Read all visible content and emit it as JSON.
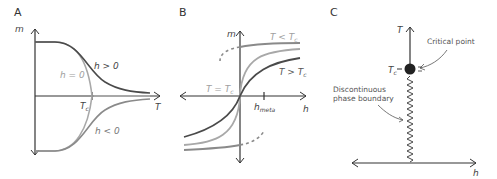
{
  "colors": {
    "axis": "#333333",
    "dark": "#4a4a4a",
    "mid": "#8a8a8a",
    "light": "#a8a8a8",
    "text_light": "#a0a0a0",
    "text_dark": "#444444"
  },
  "panels": {
    "a": {
      "letter": "A",
      "y_axis": "m",
      "x_axis": "T",
      "tc_label": "T",
      "tc_sub": "c",
      "curves": [
        {
          "label": "h > 0",
          "shade": "dark"
        },
        {
          "label": "h = 0",
          "shade": "light"
        },
        {
          "label": "h < 0",
          "shade": "mid"
        }
      ]
    },
    "b": {
      "letter": "B",
      "y_axis": "m",
      "x_axis": "h",
      "hmeta_label": "h",
      "hmeta_sub": "meta",
      "curves": [
        {
          "label": "T < T",
          "sub": "c",
          "shade": "mid"
        },
        {
          "label": "T = T",
          "sub": "c",
          "shade": "light"
        },
        {
          "label": "T > T",
          "sub": "c",
          "shade": "dark"
        }
      ]
    },
    "c": {
      "letter": "C",
      "y_axis": "T",
      "x_axis": "h",
      "tc_label": "T",
      "tc_sub": "c",
      "critical_point_label": "Critical point",
      "boundary_label_line1": "Discontinuous",
      "boundary_label_line2": "phase boundary"
    }
  }
}
